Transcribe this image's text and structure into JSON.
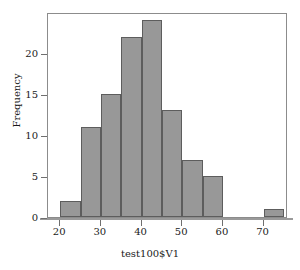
{
  "chart_data": {
    "type": "bar",
    "title": "",
    "xlabel": "test100$V1",
    "ylabel": "Frequency",
    "bin_width": 5,
    "bin_starts": [
      20,
      25,
      30,
      35,
      40,
      45,
      50,
      55,
      60,
      65,
      70
    ],
    "bin_ends": [
      25,
      30,
      35,
      40,
      45,
      50,
      55,
      60,
      65,
      70,
      75
    ],
    "categories": [
      "20-25",
      "25-30",
      "30-35",
      "35-40",
      "40-45",
      "45-50",
      "50-55",
      "55-60",
      "60-65",
      "65-70",
      "70-75"
    ],
    "values": [
      2,
      11,
      15,
      22,
      24,
      13,
      7,
      5,
      0,
      0,
      1
    ],
    "xlim": [
      17,
      76
    ],
    "ylim": [
      0,
      25
    ],
    "xticks": [
      20,
      30,
      40,
      50,
      60,
      70
    ],
    "xtick_labels": [
      "20",
      "30",
      "40",
      "50",
      "60",
      "70"
    ],
    "yticks": [
      0,
      5,
      10,
      15,
      20
    ],
    "ytick_labels": [
      "0",
      "5",
      "10",
      "15",
      "20"
    ],
    "grid": false,
    "legend": null,
    "bar_fill_color": "#989898",
    "bar_edge_color": "#5d5d5d",
    "axis_color": "#8c8c8c",
    "background_color": "#ffffff"
  }
}
